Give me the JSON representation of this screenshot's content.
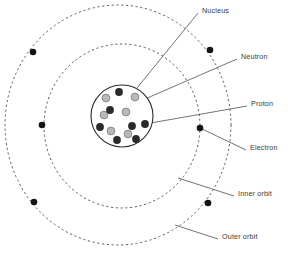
{
  "diagram": {
    "background_color": "#ffffff",
    "canvas": {
      "width": 288,
      "height": 254
    }
  },
  "colors": {
    "orbit_stroke": "#4a4a4a",
    "nucleus_stroke": "#2b2b2b",
    "neutron_fill": "#2a2a2a",
    "proton_fill": "#b9b9b9",
    "proton_stroke": "#6e6e6e",
    "electron_fill": "#141414",
    "leader_line": "#4f4f4f",
    "label_text": "#3a3a3a"
  },
  "labels": {
    "nucleus": "Nucleus",
    "neutron": "Neutron",
    "proton": "Proton",
    "electron": "Electron",
    "inner_orbit": "Inner orbit",
    "outer_orbit": "Outer orbit"
  },
  "label_positions": {
    "nucleus": {
      "x": 202,
      "y": 11
    },
    "neutron": {
      "x": 241,
      "y": 57
    },
    "proton": {
      "x": 251,
      "y": 104
    },
    "electron": {
      "x": 250,
      "y": 148
    },
    "inner_orbit": {
      "x": 238,
      "y": 194
    },
    "outer_orbit": {
      "x": 222,
      "y": 237
    }
  },
  "leader_lines": [
    {
      "name": "nucleus-leader",
      "x1": 198,
      "y1": 13,
      "x2": 137,
      "y2": 88
    },
    {
      "name": "neutron-leader",
      "x1": 237,
      "y1": 59,
      "x2": 145,
      "y2": 99
    },
    {
      "name": "proton-leader",
      "x1": 247,
      "y1": 106,
      "x2": 145,
      "y2": 124
    },
    {
      "name": "electron-leader",
      "x1": 246,
      "y1": 150,
      "x2": 200,
      "y2": 128
    },
    {
      "name": "inner-orbit-leader",
      "x1": 234,
      "y1": 196,
      "x2": 178,
      "y2": 178
    },
    {
      "name": "outer-orbit-leader",
      "x1": 218,
      "y1": 239,
      "x2": 175,
      "y2": 225
    }
  ],
  "orbits": [
    {
      "name": "outer-orbit",
      "label_ref": "outer_orbit",
      "cx": 118,
      "cy": 125,
      "rx": 113,
      "ry": 120,
      "style": "dashed",
      "dash": "2.2 2.6",
      "stroke_width": 0.9
    },
    {
      "name": "inner-orbit",
      "label_ref": "inner_orbit",
      "cx": 122,
      "cy": 126,
      "rx": 78,
      "ry": 82,
      "style": "dashed",
      "dash": "2.2 2.6",
      "stroke_width": 0.9
    }
  ],
  "nucleus": {
    "cx": 122,
    "cy": 116,
    "r": 31,
    "stroke_width": 1.1
  },
  "particles": {
    "neutron_label": "Neutron",
    "proton_label": "Proton",
    "radius": 3.9,
    "neutrons": [
      {
        "x": 119,
        "y": 92
      },
      {
        "x": 110,
        "y": 110
      },
      {
        "x": 100,
        "y": 127
      },
      {
        "x": 132,
        "y": 126
      },
      {
        "x": 145,
        "y": 124
      },
      {
        "x": 117,
        "y": 140
      },
      {
        "x": 136,
        "y": 139
      }
    ],
    "protons": [
      {
        "x": 106,
        "y": 98
      },
      {
        "x": 135,
        "y": 97
      },
      {
        "x": 104,
        "y": 115
      },
      {
        "x": 126,
        "y": 112
      },
      {
        "x": 111,
        "y": 131
      },
      {
        "x": 128,
        "y": 134
      }
    ]
  },
  "electrons": {
    "label": "Electron",
    "radius": 3.3,
    "outer": [
      {
        "x": 33,
        "y": 52
      },
      {
        "x": 210,
        "y": 50
      },
      {
        "x": 34,
        "y": 202
      },
      {
        "x": 208,
        "y": 203
      }
    ],
    "inner": [
      {
        "x": 42,
        "y": 125
      },
      {
        "x": 200,
        "y": 128
      }
    ]
  }
}
